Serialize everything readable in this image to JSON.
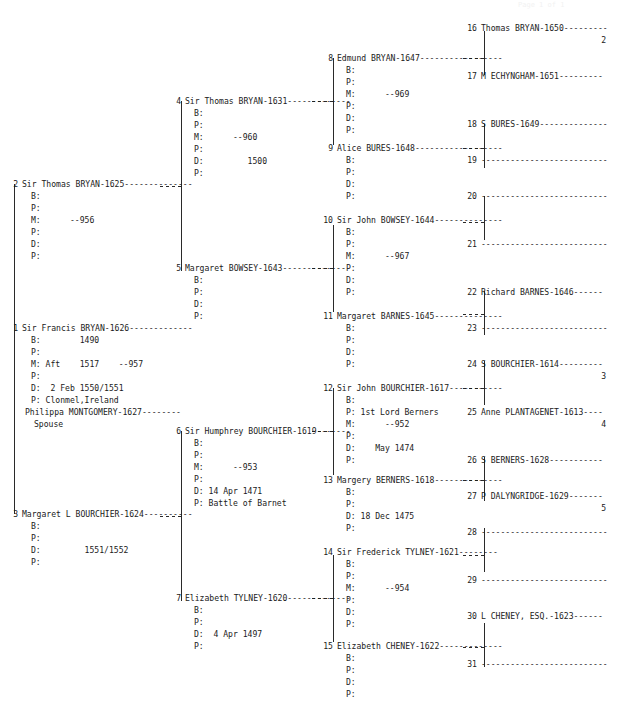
{
  "page": {
    "header_faint": "Page 1 of 1"
  },
  "labels": {
    "b": "B:",
    "p": "P:",
    "m": "M:",
    "d": "D:",
    "spouse": "Spouse"
  },
  "generation1": [
    {
      "num": "1",
      "name": "Sir Francis BRYAN-1626-------------",
      "b": "B:        1490",
      "p1": "P:",
      "m": "M: Aft    1517    --957",
      "p2": "P:",
      "d": "D:  2 Feb 1550/1551",
      "p3": "P: Clonmel,Ireland",
      "spouse_name": "Philippa MONTGOMERY-1627--------",
      "spouse_label": "Spouse"
    }
  ],
  "generation2": [
    {
      "num": "2",
      "name": "Sir Thomas BRYAN-1625--------------",
      "lines": [
        "B:",
        "P:",
        "M:      --956",
        "P:",
        "D:",
        "P:"
      ]
    },
    {
      "num": "3",
      "name": "Margaret L BOURCHIER-1624----------",
      "lines": [
        "B:",
        "P:",
        "D:         1551/1552",
        "P:"
      ]
    }
  ],
  "generation3": [
    {
      "num": "4",
      "name": "Sir Thomas BRYAN-1631-------------",
      "lines": [
        "B:",
        "P:",
        "M:      --960",
        "P:",
        "D:         1500",
        "P:"
      ]
    },
    {
      "num": "5",
      "name": "Margaret BOWSEY-1643--------------",
      "lines": [
        "B:",
        "P:",
        "D:",
        "P:"
      ]
    },
    {
      "num": "6",
      "name": "Sir Humphrey BOURCHIER-1619-------",
      "lines": [
        "B:",
        "P:",
        "M:      --953",
        "P:",
        "D: 14 Apr 1471",
        "P: Battle of Barnet"
      ]
    },
    {
      "num": "7",
      "name": "Elizabeth TYLNEY-1620-------------",
      "lines": [
        "B:",
        "P:",
        "D:  4 Apr 1497",
        "P:"
      ]
    }
  ],
  "generation4": [
    {
      "num": "8",
      "name": "Edmund BRYAN-1647-----------------",
      "lines": [
        "B:",
        "P:",
        "M:      --969",
        "P:",
        "D:",
        "P:"
      ]
    },
    {
      "num": "9",
      "name": "Alice BURES-1648------------------",
      "lines": [
        "B:",
        "P:",
        "D:",
        "P:"
      ]
    },
    {
      "num": "10",
      "name": "Sir John BOWSEY-1644--------------",
      "lines": [
        "B:",
        "P:",
        "M:      --967",
        "P:",
        "D:",
        "P:"
      ]
    },
    {
      "num": "11",
      "name": "Margaret BARNES-1645--------------",
      "lines": [
        "B:",
        "P:",
        "D:",
        "P:"
      ]
    },
    {
      "num": "12",
      "name": "Sir John BOURCHIER-1617-----------",
      "lines": [
        "B:",
        "P: 1st Lord Berners",
        "M:      --952",
        "P:",
        "D:    May 1474",
        "P:"
      ]
    },
    {
      "num": "13",
      "name": "Margery BERNERS-1618--------------",
      "lines": [
        "B:",
        "P:",
        "D: 18 Dec 1475",
        "P:"
      ]
    },
    {
      "num": "14",
      "name": "Sir Frederick TYLNEY-1621--------",
      "lines": [
        "B:",
        "P:",
        "M:      --954",
        "P:",
        "D:",
        "P:"
      ]
    },
    {
      "num": "15",
      "name": "Elizabeth CHENEY-1622-------------",
      "lines": [
        "B:",
        "P:",
        "D:",
        "P:"
      ]
    }
  ],
  "generation5": [
    {
      "num": "16",
      "name": "Thomas BRYAN-1650---------",
      "cont": "2"
    },
    {
      "num": "17",
      "name": "M ECHYNGHAM-1651---------",
      "cont": ""
    },
    {
      "num": "18",
      "name": "S BURES-1649--------------",
      "cont": ""
    },
    {
      "num": "19",
      "name": "--------------------------",
      "cont": ""
    },
    {
      "num": "20",
      "name": "--------------------------",
      "cont": ""
    },
    {
      "num": "21",
      "name": "--------------------------",
      "cont": ""
    },
    {
      "num": "22",
      "name": "Richard BARNES-1646------",
      "cont": ""
    },
    {
      "num": "23",
      "name": "--------------------------",
      "cont": ""
    },
    {
      "num": "24",
      "name": "S BOURCHIER-1614---------",
      "cont": "3"
    },
    {
      "num": "25",
      "name": "Anne PLANTAGENET-1613----",
      "cont": "4"
    },
    {
      "num": "26",
      "name": "S BERNERS-1628-----------",
      "cont": ""
    },
    {
      "num": "27",
      "name": "P DALYNGRIDGE-1629-------",
      "cont": "5"
    },
    {
      "num": "28",
      "name": "--------------------------",
      "cont": ""
    },
    {
      "num": "29",
      "name": "--------------------------",
      "cont": ""
    },
    {
      "num": "30",
      "name": "L CHENEY, ESQ.-1623------",
      "cont": ""
    },
    {
      "num": "31",
      "name": "--------------------------",
      "cont": ""
    }
  ]
}
